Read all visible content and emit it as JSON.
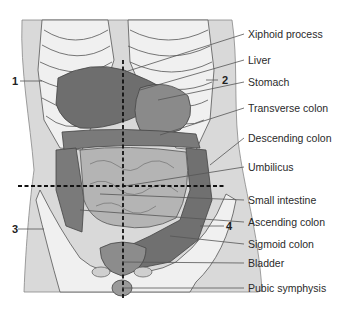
{
  "diagram": {
    "labels": [
      {
        "id": "xiphoid",
        "text": "Xiphoid process"
      },
      {
        "id": "liver",
        "text": "Liver"
      },
      {
        "id": "stomach",
        "text": "Stomach"
      },
      {
        "id": "transverse_colon",
        "text": "Transverse colon"
      },
      {
        "id": "descending_colon",
        "text": "Descending colon"
      },
      {
        "id": "umbilicus",
        "text": "Umbilicus"
      },
      {
        "id": "small_intestine",
        "text": "Small intestine"
      },
      {
        "id": "ascending_colon",
        "text": "Ascending colon"
      },
      {
        "id": "sigmoid_colon",
        "text": "Sigmoid colon"
      },
      {
        "id": "bladder",
        "text": "Bladder"
      },
      {
        "id": "pubic_symphysis",
        "text": "Pubic symphysis"
      }
    ],
    "quadrants": [
      {
        "id": "q1",
        "text": "1"
      },
      {
        "id": "q2",
        "text": "2"
      },
      {
        "id": "q3",
        "text": "3"
      },
      {
        "id": "q4",
        "text": "4"
      }
    ],
    "colors": {
      "skin": "#d9d9d9",
      "bone": "#f2f2f2",
      "organ_dark": "#6e6e6e",
      "organ_mid": "#8c8c8c",
      "intestine": "#b4b4b4",
      "outline": "#4a4a4a",
      "leader": "#555555"
    }
  }
}
